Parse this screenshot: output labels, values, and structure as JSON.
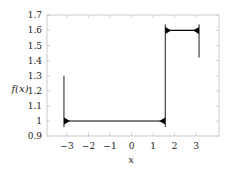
{
  "chart_data": {
    "type": "line",
    "title": "",
    "xlabel": "x",
    "ylabel": "f(x)",
    "xlim": [
      -3.8,
      4.1
    ],
    "ylim": [
      0.9,
      1.7
    ],
    "grid": false,
    "legend": null,
    "x_ticks": [
      "−3",
      "−2",
      "−1",
      "0",
      "1",
      "2",
      "3"
    ],
    "x_tick_values": [
      -3,
      -2,
      -1,
      0,
      1,
      2,
      3
    ],
    "y_ticks": [
      "0.9",
      "1",
      "1.1",
      "1.2",
      "1.3",
      "1.4",
      "1.5",
      "1.6",
      "1.7"
    ],
    "y_tick_values": [
      0.9,
      1.0,
      1.1,
      1.2,
      1.3,
      1.4,
      1.5,
      1.6,
      1.7
    ],
    "series": [
      {
        "name": "f(x) partial Fourier sum (Gibbs oscillation)",
        "color": "#000000",
        "segments": [
          {
            "x_start": -3.1416,
            "x_end": 1.5708,
            "level": 1.0
          },
          {
            "x_start": 1.5708,
            "x_end": 3.1416,
            "level": 1.6
          }
        ],
        "spikes": [
          {
            "x": -3.1416,
            "y_min": 0.96,
            "y_max": 1.3
          },
          {
            "x": 1.5708,
            "y_min": 0.96,
            "y_max": 1.64
          },
          {
            "x": 3.1416,
            "y_min": 1.42,
            "y_max": 1.64
          }
        ]
      }
    ]
  }
}
